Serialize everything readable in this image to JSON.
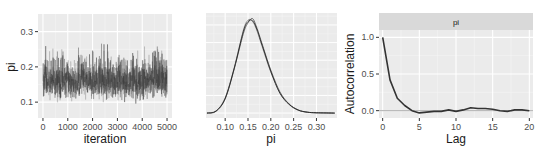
{
  "chart_data": [
    {
      "type": "line",
      "title": "",
      "xlabel": "iteration",
      "ylabel": "pi",
      "xlim": [
        -200,
        5200
      ],
      "ylim": [
        0.055,
        0.35
      ],
      "x_ticks": [
        0,
        1000,
        2000,
        3000,
        4000,
        5000
      ],
      "x_tick_labels": [
        "0",
        "1000",
        "2000",
        "3000",
        "4000",
        "5000"
      ],
      "y_ticks": [
        0.1,
        0.2,
        0.3
      ],
      "y_tick_labels": [
        "0.1",
        "0.2",
        "0.3"
      ],
      "grid": true,
      "description": "MCMC trace plot of pi over 5000 iterations for multiple chains, values fluctuating mostly between 0.07 and 0.30 centered near 0.16",
      "series_summary": {
        "n_chains": 3,
        "center": 0.16,
        "min": 0.06,
        "max": 0.34
      }
    },
    {
      "type": "line",
      "title": "",
      "xlabel": "pi",
      "ylabel": "",
      "xlim": [
        0.058,
        0.345
      ],
      "x_ticks": [
        0.1,
        0.15,
        0.2,
        0.25,
        0.3
      ],
      "x_tick_labels": [
        "0.10",
        "0.15",
        "0.20",
        "0.25",
        "0.30"
      ],
      "grid": true,
      "description": "Posterior density of pi, overlaid per chain, peak near 0.155",
      "series": [
        {
          "name": "chain 1",
          "x": [
            0.06,
            0.08,
            0.1,
            0.12,
            0.14,
            0.15,
            0.16,
            0.17,
            0.18,
            0.2,
            0.22,
            0.24,
            0.26,
            0.28,
            0.3,
            0.34
          ],
          "y": [
            0.0,
            0.3,
            2.2,
            6.5,
            11.8,
            13.2,
            13.0,
            11.6,
            9.6,
            5.8,
            2.9,
            1.2,
            0.4,
            0.12,
            0.04,
            0.0
          ]
        },
        {
          "name": "chain 2",
          "x": [
            0.06,
            0.08,
            0.1,
            0.12,
            0.14,
            0.15,
            0.16,
            0.17,
            0.18,
            0.2,
            0.22,
            0.24,
            0.26,
            0.28,
            0.3,
            0.34
          ],
          "y": [
            0.0,
            0.3,
            2.0,
            6.3,
            11.3,
            12.8,
            13.4,
            12.0,
            10.0,
            6.1,
            3.0,
            1.3,
            0.45,
            0.13,
            0.04,
            0.0
          ]
        },
        {
          "name": "chain 3",
          "x": [
            0.06,
            0.08,
            0.1,
            0.12,
            0.14,
            0.15,
            0.16,
            0.17,
            0.18,
            0.2,
            0.22,
            0.24,
            0.26,
            0.28,
            0.3,
            0.34
          ],
          "y": [
            0.0,
            0.25,
            2.1,
            6.4,
            11.6,
            13.0,
            13.1,
            11.8,
            9.8,
            5.9,
            2.8,
            1.25,
            0.42,
            0.12,
            0.04,
            0.0
          ]
        }
      ]
    },
    {
      "type": "line",
      "title": "pi",
      "xlabel": "Lag",
      "ylabel": "Autocorrelation",
      "xlim": [
        -0.5,
        20.5
      ],
      "ylim": [
        -0.1,
        1.1
      ],
      "x_ticks": [
        0,
        5,
        10,
        15,
        20
      ],
      "x_tick_labels": [
        "0",
        "5",
        "10",
        "15",
        "20"
      ],
      "y_ticks": [
        0.0,
        0.5,
        1.0
      ],
      "y_tick_labels": [
        "0.0",
        "0.5",
        "1.0"
      ],
      "grid": true,
      "facet_strip": "pi",
      "x": [
        0,
        1,
        2,
        3,
        4,
        5,
        6,
        7,
        8,
        9,
        10,
        11,
        12,
        13,
        14,
        15,
        16,
        17,
        18,
        19,
        20
      ],
      "values": [
        1.0,
        0.42,
        0.17,
        0.07,
        0.0,
        -0.03,
        -0.02,
        -0.01,
        -0.01,
        0.01,
        -0.01,
        0.01,
        0.04,
        0.03,
        0.03,
        0.02,
        0.0,
        -0.01,
        0.01,
        0.01,
        0.0
      ]
    }
  ],
  "labels": {
    "p1_xlabel": "iteration",
    "p1_ylabel": "pi",
    "p2_xlabel": "pi",
    "p3_xlabel": "Lag",
    "p3_ylabel": "Autocorrelation",
    "p3_strip": "pi"
  }
}
